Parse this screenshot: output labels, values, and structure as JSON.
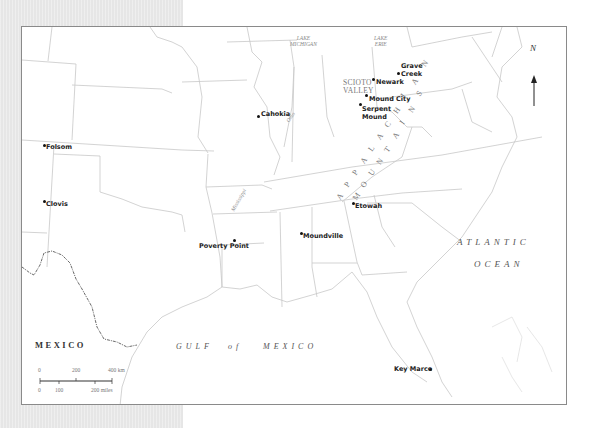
{
  "map": {
    "sites": [
      {
        "name": "Cahokia",
        "label": "Cahokia"
      },
      {
        "name": "Folsom",
        "label": "Folsom"
      },
      {
        "name": "Clovis",
        "label": "Clovis"
      },
      {
        "name": "Poverty Point",
        "label": "Poverty Point"
      },
      {
        "name": "Moundville",
        "label": "Moundville"
      },
      {
        "name": "Etowah",
        "label": "Etowah"
      },
      {
        "name": "Newark",
        "label": "Newark"
      },
      {
        "name": "Grave Creek",
        "label_line1": "Grave",
        "label_line2": "Creek"
      },
      {
        "name": "Mound City",
        "label": "Mound City"
      },
      {
        "name": "Serpent Mound",
        "label_line1": "Serpent",
        "label_line2": "Mound"
      },
      {
        "name": "Key Marco",
        "label": "Key Marco"
      }
    ],
    "regions": {
      "scioto_line1": "SCIOTO",
      "scioto_line2": "VALLEY"
    },
    "lakes": {
      "michigan_line1": "LAKE",
      "michigan_line2": "MICHIGAN",
      "erie_line1": "LAKE",
      "erie_line2": "ERIE"
    },
    "rivers": {
      "ohio": "Ohio",
      "mississippi": "Mississippi"
    },
    "mountains": {
      "appalachian": [
        "A",
        "P",
        "P",
        "A",
        "L",
        "A",
        "C",
        "H",
        "I",
        "A",
        "N"
      ],
      "mountains": [
        "M",
        "O",
        "U",
        "N",
        "T",
        "A",
        "I",
        "N",
        "S"
      ]
    },
    "water": {
      "atlantic_line1": "ATLANTIC",
      "atlantic_line2": "OCEAN",
      "gulf_1": "GULF",
      "gulf_2": "of",
      "gulf_3": "MEXICO"
    },
    "country": "MEXICO",
    "north_arrow": "N",
    "scale": {
      "km_0": "0",
      "km_200": "200",
      "km_400": "400 km",
      "mi_0": "0",
      "mi_100": "100",
      "mi_200": "200 miles"
    },
    "colors": {
      "border": "#c8c8c8",
      "frame": "#8a8a8a",
      "gray_page": "#e6e6e6",
      "mexico_border": "#444444"
    }
  }
}
